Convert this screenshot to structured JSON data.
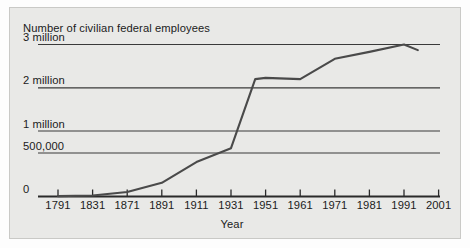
{
  "figure": {
    "background_color": "#e9e9e7",
    "frame_color": "#c9c9c6",
    "ink_color": "#1b1b1b"
  },
  "chart_data": {
    "type": "line",
    "title": "Number of civilian federal employees",
    "xlabel": "Year",
    "ylabel": "",
    "grid": true,
    "legend": "none",
    "x_tick_labels": [
      "1791",
      "1831",
      "1871",
      "1891",
      "1911",
      "1931",
      "1951",
      "1961",
      "1971",
      "1981",
      "1991",
      "2001"
    ],
    "y_tick_labels": [
      "0",
      "500,000",
      "1 million",
      "2 million",
      "3 million"
    ],
    "y_tick_values": [
      0,
      500000,
      1000000,
      2000000,
      3000000
    ],
    "y_scale_note": "non-linear: equal spacing between 0, 500,000, 1 million, 2 million, 3 million",
    "x_scale_note": "categorical tick spacing; 1791-1831-1871 are 40-year steps, 1891-2001 are 20- then 10-year steps",
    "series": [
      {
        "name": "Civilian federal employees",
        "color": "#4a4a4a",
        "points": [
          {
            "x": "1791",
            "y": 4500
          },
          {
            "x": "1831",
            "y": 11500
          },
          {
            "x": "1871",
            "y": 51000
          },
          {
            "x": "1891",
            "y": 157000
          },
          {
            "x": "1911",
            "y": 396000
          },
          {
            "x": "1931",
            "y": 610000
          },
          {
            "x": "1945",
            "y": 2200000
          },
          {
            "x": "1951",
            "y": 2230000
          },
          {
            "x": "1961",
            "y": 2200000
          },
          {
            "x": "1971",
            "y": 2670000
          },
          {
            "x": "1981",
            "y": 2830000
          },
          {
            "x": "1991",
            "y": 3000000
          },
          {
            "x": "1995",
            "y": 2870000
          }
        ]
      }
    ]
  }
}
